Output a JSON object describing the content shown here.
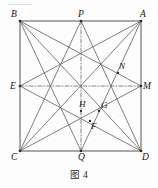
{
  "figure": {
    "caption": "图 4",
    "top_partial_text": "———",
    "shape": "square",
    "stroke_color": "#555555",
    "dash_color": "#666666",
    "background": "#fdfdfd",
    "square": {
      "name": "ABDC",
      "left": 20,
      "top": 21,
      "right": 141,
      "bottom": 151
    },
    "points": [
      {
        "id": "B",
        "label": "B",
        "x": 20,
        "y": 21,
        "role": "vertex",
        "label_dx": -9,
        "label_dy": -11
      },
      {
        "id": "P",
        "label": "P",
        "x": 81,
        "y": 21,
        "role": "midpoint",
        "label_dx": -3,
        "label_dy": -11
      },
      {
        "id": "A",
        "label": "A",
        "x": 141,
        "y": 21,
        "role": "vertex",
        "label_dx": -1,
        "label_dy": -11
      },
      {
        "id": "E",
        "label": "E",
        "x": 20,
        "y": 86,
        "role": "midpoint",
        "label_dx": -10,
        "label_dy": -4
      },
      {
        "id": "M",
        "label": "M",
        "x": 141,
        "y": 86,
        "role": "midpoint",
        "label_dx": 2,
        "label_dy": -4
      },
      {
        "id": "C",
        "label": "C",
        "x": 20,
        "y": 151,
        "role": "vertex",
        "label_dx": -9,
        "label_dy": 2
      },
      {
        "id": "Q",
        "label": "Q",
        "x": 81,
        "y": 151,
        "role": "midpoint",
        "label_dx": -3,
        "label_dy": 2
      },
      {
        "id": "D",
        "label": "D",
        "x": 141,
        "y": 151,
        "role": "vertex",
        "label_dx": 1,
        "label_dy": 2
      },
      {
        "id": "N",
        "label": "N",
        "x": 118,
        "y": 73,
        "role": "intersection",
        "label_dx": 1,
        "label_dy": -11
      },
      {
        "id": "H",
        "label": "H",
        "x": 81,
        "y": 111,
        "role": "intersection",
        "label_dx": -2,
        "label_dy": -11
      },
      {
        "id": "G",
        "label": "G",
        "x": 99,
        "y": 111,
        "role": "intersection",
        "label_dx": 2,
        "label_dy": -10
      },
      {
        "id": "F",
        "label": "F",
        "x": 90,
        "y": 121,
        "role": "intersection",
        "label_dx": 1,
        "label_dy": 1
      }
    ],
    "solid_segments": [
      {
        "from": "B",
        "to": "A",
        "kind": "square-side"
      },
      {
        "from": "A",
        "to": "D",
        "kind": "square-side"
      },
      {
        "from": "D",
        "to": "C",
        "kind": "square-side"
      },
      {
        "from": "C",
        "to": "B",
        "kind": "square-side"
      },
      {
        "from": "B",
        "to": "D",
        "kind": "diagonal"
      },
      {
        "from": "A",
        "to": "C",
        "kind": "diagonal"
      },
      {
        "from": "B",
        "to": "M",
        "kind": "cevian"
      },
      {
        "from": "B",
        "to": "Q",
        "kind": "cevian"
      },
      {
        "from": "A",
        "to": "E",
        "kind": "cevian"
      },
      {
        "from": "A",
        "to": "Q",
        "kind": "cevian"
      },
      {
        "from": "C",
        "to": "M",
        "kind": "cevian"
      },
      {
        "from": "C",
        "to": "P",
        "kind": "cevian"
      },
      {
        "from": "D",
        "to": "E",
        "kind": "cevian"
      },
      {
        "from": "D",
        "to": "P",
        "kind": "cevian"
      }
    ],
    "dashed_segments": [
      {
        "from": "E",
        "to": "M",
        "kind": "horizontal-midline"
      },
      {
        "from": "P",
        "to": "Q",
        "kind": "vertical-midline"
      }
    ],
    "marked_dots": [
      "B",
      "P",
      "A",
      "E",
      "M",
      "C",
      "Q",
      "D",
      "N",
      "H",
      "G",
      "F"
    ]
  }
}
